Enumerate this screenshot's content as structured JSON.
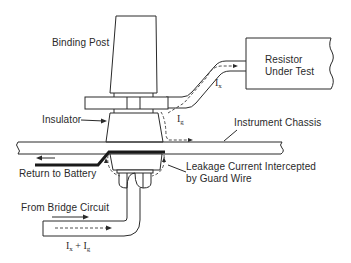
{
  "diagram": {
    "labels": {
      "binding_post": "Binding Post",
      "resistor": "Resistor\nUnder Test",
      "resistor_line1": "Resistor",
      "resistor_line2": "Under Test",
      "insulator": "Insulator",
      "instrument_chassis": "Instrument Chassis",
      "return_to_battery": "Return to Battery",
      "leakage_line1": "Leakage Current Intercepted",
      "leakage_line2": "by Guard Wire",
      "from_bridge": "From Bridge Circuit"
    },
    "symbols": {
      "ix_base": "I",
      "ix_sub": "x",
      "ig_base": "I",
      "ig_sub": "g",
      "sum_ix_base": "I",
      "sum_ix_sub": "x",
      "sum_plus": "+",
      "sum_ig_base": "I",
      "sum_ig_sub": "g"
    },
    "colors": {
      "line": "#2a2a2a",
      "background": "#ffffff"
    }
  }
}
